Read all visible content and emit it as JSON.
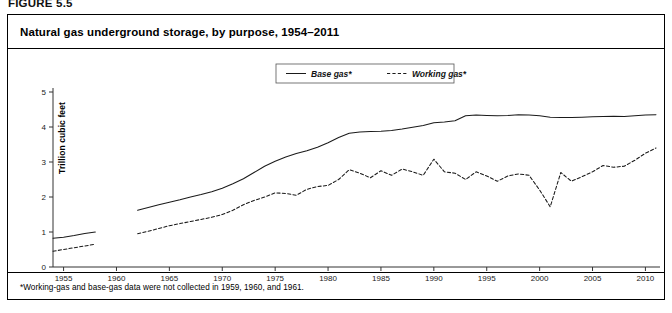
{
  "figure": {
    "number": "FIGURE 5.5"
  },
  "title": "Natural gas underground storage, by purpose, 1954–2011",
  "footnote": "*Working-gas and base-gas data were not collected in 1959, 1960, and 1961.",
  "axes": {
    "ylabel": "Trillion cubic feet",
    "yticks": [
      "0",
      "1",
      "2",
      "3",
      "4",
      "5"
    ],
    "xticks": [
      "1955",
      "1960",
      "1965",
      "1970",
      "1975",
      "1980",
      "1985",
      "1990",
      "1995",
      "2000",
      "2005",
      "2010"
    ]
  },
  "legend": {
    "items": [
      {
        "label": "Base gas*",
        "style": "solid"
      },
      {
        "label": "Working gas*",
        "style": "dashed"
      }
    ]
  },
  "colors": {
    "line": "#1a1a1a",
    "axis": "#333333",
    "background": "#ffffff"
  },
  "chart_data": {
    "type": "line",
    "title": "Natural gas underground storage, by purpose, 1954–2011",
    "xlabel": "",
    "ylabel": "Trillion cubic feet",
    "xlim": [
      1954,
      2011
    ],
    "ylim": [
      0,
      5
    ],
    "grid": false,
    "legend_position": "top-center",
    "annotations": [
      "*Working-gas and base-gas data were not collected in 1959, 1960, and 1961."
    ],
    "x": [
      1954,
      1955,
      1956,
      1957,
      1958,
      1962,
      1963,
      1964,
      1965,
      1966,
      1967,
      1968,
      1969,
      1970,
      1971,
      1972,
      1973,
      1974,
      1975,
      1976,
      1977,
      1978,
      1979,
      1980,
      1981,
      1982,
      1983,
      1984,
      1985,
      1986,
      1987,
      1988,
      1989,
      1990,
      1991,
      1992,
      1993,
      1994,
      1995,
      1996,
      1997,
      1998,
      1999,
      2000,
      2001,
      2002,
      2003,
      2004,
      2005,
      2006,
      2007,
      2008,
      2009,
      2010,
      2011
    ],
    "series": [
      {
        "name": "Base gas*",
        "style": "solid",
        "values": [
          0.82,
          0.85,
          0.9,
          0.96,
          1.0,
          1.62,
          1.7,
          1.78,
          1.85,
          1.92,
          2.0,
          2.07,
          2.15,
          2.25,
          2.38,
          2.52,
          2.7,
          2.88,
          3.02,
          3.14,
          3.24,
          3.32,
          3.42,
          3.55,
          3.7,
          3.82,
          3.86,
          3.87,
          3.88,
          3.9,
          3.94,
          3.99,
          4.04,
          4.12,
          4.14,
          4.18,
          4.32,
          4.34,
          4.33,
          4.32,
          4.33,
          4.35,
          4.34,
          4.32,
          4.28,
          4.27,
          4.27,
          4.28,
          4.29,
          4.3,
          4.31,
          4.3,
          4.32,
          4.34,
          4.35
        ]
      },
      {
        "name": "Working gas*",
        "style": "dashed",
        "values": [
          0.45,
          0.5,
          0.55,
          0.6,
          0.65,
          0.95,
          1.02,
          1.1,
          1.18,
          1.24,
          1.3,
          1.36,
          1.42,
          1.5,
          1.62,
          1.78,
          1.9,
          2.0,
          2.12,
          2.1,
          2.05,
          2.22,
          2.3,
          2.33,
          2.5,
          2.78,
          2.68,
          2.55,
          2.75,
          2.62,
          2.8,
          2.72,
          2.62,
          3.08,
          2.72,
          2.68,
          2.5,
          2.72,
          2.6,
          2.45,
          2.6,
          2.66,
          2.62,
          2.2,
          1.72,
          2.7,
          2.45,
          2.58,
          2.72,
          2.9,
          2.85,
          2.88,
          3.05,
          3.25,
          3.4
        ]
      }
    ]
  }
}
